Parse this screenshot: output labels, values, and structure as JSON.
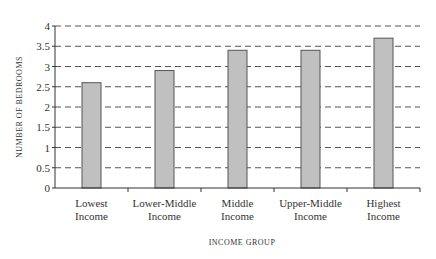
{
  "chart_data": {
    "type": "bar",
    "title": "",
    "xlabel": "INCOME GROUP",
    "ylabel": "NUMBER OF BEDROOMS",
    "categories": [
      [
        "Lowest",
        "Income"
      ],
      [
        "Lower-Middle",
        "Income"
      ],
      [
        "Middle",
        "Income"
      ],
      [
        "Upper-Middle",
        "Income"
      ],
      [
        "Highest",
        "Income"
      ]
    ],
    "values": [
      2.6,
      2.9,
      3.4,
      3.4,
      3.7
    ],
    "ylim": [
      0,
      4
    ],
    "yticks": [
      0,
      0.5,
      1,
      1.5,
      2,
      2.5,
      3,
      3.5,
      4
    ],
    "grid": true,
    "legend": null,
    "colors": {
      "bar": "#c0c0c0",
      "bar_border": "#555555",
      "grid": "#555555",
      "axis": "#333333"
    }
  }
}
